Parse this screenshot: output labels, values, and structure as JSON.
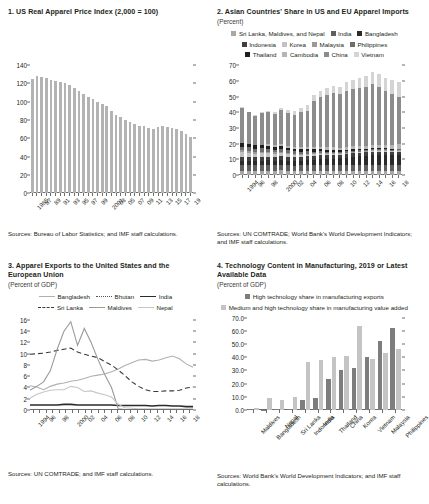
{
  "panel1": {
    "title": "1. US Real Apparel Price Index (2,000 = 100)",
    "source": "Sources: Bureau of Labor Statistics; and IMF staff calculations.",
    "chart_data": {
      "type": "bar",
      "title": "US Real Apparel Price Index (2,000 = 100)",
      "xlabel": "",
      "ylabel": "",
      "ylim": [
        0,
        140
      ],
      "yticks": [
        0,
        20,
        40,
        60,
        80,
        100,
        120,
        140
      ],
      "grid": false,
      "bar_color": "#b3b3b3",
      "categories": [
        "1985",
        "86",
        "87",
        "88",
        "89",
        "90",
        "91",
        "92",
        "93",
        "94",
        "95",
        "96",
        "97",
        "98",
        "99",
        "2000",
        "01",
        "02",
        "03",
        "04",
        "05",
        "06",
        "07",
        "08",
        "09",
        "10",
        "11",
        "12",
        "13",
        "14",
        "15",
        "16",
        "17",
        "18",
        "19"
      ],
      "tick_labels": [
        "1985",
        "",
        "87",
        "",
        "89",
        "",
        "91",
        "",
        "93",
        "",
        "95",
        "",
        "97",
        "",
        "99",
        "",
        "2001",
        "",
        "03",
        "",
        "05",
        "",
        "07",
        "",
        "09",
        "",
        "11",
        "",
        "13",
        "",
        "15",
        "",
        "17",
        "",
        "19"
      ],
      "values": [
        125,
        128,
        127,
        126,
        124,
        123,
        122,
        121,
        118,
        115,
        112,
        108,
        105,
        103,
        100,
        98,
        95,
        90,
        86,
        83,
        80,
        78,
        76,
        74,
        73,
        71,
        70,
        72,
        73,
        72,
        71,
        70,
        68,
        65,
        62
      ]
    }
  },
  "panel2": {
    "title": "2. Asian Countries' Share in US and EU Apparel Imports",
    "subtitle": "(Percent)",
    "source": "Sources: UN COMTRADE; World Bank's World Development Indicators; and IMF staff calculations.",
    "legend_rows": [
      [
        {
          "label": "Sri Lanka, Maldives, and Nepal",
          "color": "#a8a8a8"
        },
        {
          "label": "India",
          "color": "#5f5f5f"
        },
        {
          "label": "Bangladesh",
          "color": "#2b2b2b"
        }
      ],
      [
        {
          "label": "Indonesia",
          "color": "#3f3f3f"
        },
        {
          "label": "Korea",
          "color": "#c2c2c2"
        },
        {
          "label": "Malaysia",
          "color": "#9a9a9a"
        },
        {
          "label": "Philippines",
          "color": "#6e6e6e"
        }
      ],
      [
        {
          "label": "Thailand",
          "color": "#1f1f1f"
        },
        {
          "label": "Cambodia",
          "color": "#b5b5b5"
        },
        {
          "label": "China",
          "color": "#8c8c8c"
        },
        {
          "label": "Vietnam",
          "color": "#d4d4d4"
        }
      ]
    ],
    "chart_data": {
      "type": "bar",
      "stacked": true,
      "title": "Asian Countries' Share in US and EU Apparel Imports",
      "xlabel": "",
      "ylabel": "Percent",
      "ylim": [
        0,
        70
      ],
      "yticks": [
        0,
        10,
        20,
        30,
        40,
        50,
        60,
        70
      ],
      "grid": false,
      "categories": [
        "1994",
        "95",
        "96",
        "97",
        "98",
        "99",
        "2000",
        "01",
        "02",
        "03",
        "04",
        "05",
        "06",
        "07",
        "08",
        "09",
        "10",
        "11",
        "12",
        "13",
        "14",
        "15",
        "16",
        "17",
        "18"
      ],
      "tick_labels": [
        "1994",
        "",
        "96",
        "",
        "98",
        "",
        "2000",
        "",
        "02",
        "",
        "04",
        "",
        "06",
        "",
        "08",
        "",
        "10",
        "",
        "12",
        "",
        "14",
        "",
        "16",
        "",
        "18"
      ],
      "series": [
        {
          "name": "Sri Lanka, Maldives, and Nepal",
          "color": "#a8a8a8",
          "values": [
            3.0,
            2.9,
            2.8,
            2.9,
            3.0,
            2.9,
            3.1,
            2.8,
            2.7,
            2.8,
            2.9,
            2.6,
            2.6,
            2.6,
            2.6,
            2.5,
            2.5,
            2.6,
            2.6,
            2.6,
            2.7,
            2.6,
            2.6,
            2.5,
            2.5
          ]
        },
        {
          "name": "India",
          "color": "#5f5f5f",
          "values": [
            3.6,
            3.5,
            3.4,
            3.5,
            3.6,
            3.5,
            3.7,
            3.5,
            3.4,
            3.5,
            3.6,
            3.9,
            3.9,
            3.8,
            3.7,
            3.7,
            3.7,
            3.8,
            3.8,
            3.9,
            4.0,
            3.9,
            3.8,
            3.7,
            3.7
          ]
        },
        {
          "name": "Bangladesh",
          "color": "#2b2b2b",
          "values": [
            2.6,
            2.7,
            2.8,
            2.9,
            3.0,
            2.9,
            3.0,
            3.0,
            2.9,
            3.0,
            3.2,
            3.5,
            3.8,
            4.0,
            4.3,
            4.6,
            4.9,
            5.3,
            5.6,
            5.9,
            6.2,
            6.4,
            6.6,
            6.7,
            6.8
          ]
        },
        {
          "name": "Indonesia",
          "color": "#3f3f3f",
          "values": [
            2.4,
            2.4,
            2.3,
            2.4,
            2.3,
            2.3,
            2.5,
            2.4,
            2.3,
            2.3,
            2.3,
            2.3,
            2.3,
            2.3,
            2.3,
            2.2,
            2.2,
            2.2,
            2.2,
            2.1,
            2.1,
            2.0,
            2.0,
            2.0,
            2.0
          ]
        },
        {
          "name": "Korea",
          "color": "#c2c2c2",
          "values": [
            3.2,
            2.9,
            2.5,
            2.3,
            2.1,
            1.9,
            1.8,
            1.6,
            1.4,
            1.2,
            1.0,
            0.9,
            0.8,
            0.7,
            0.6,
            0.5,
            0.5,
            0.5,
            0.4,
            0.4,
            0.4,
            0.4,
            0.4,
            0.4,
            0.4
          ]
        },
        {
          "name": "Malaysia",
          "color": "#9a9a9a",
          "values": [
            1.3,
            1.2,
            1.2,
            1.1,
            1.1,
            1.0,
            1.0,
            0.9,
            0.9,
            0.8,
            0.8,
            0.7,
            0.7,
            0.7,
            0.6,
            0.6,
            0.6,
            0.6,
            0.5,
            0.5,
            0.5,
            0.5,
            0.5,
            0.4,
            0.4
          ]
        },
        {
          "name": "Philippines",
          "color": "#6e6e6e",
          "values": [
            2.2,
            2.1,
            2.0,
            2.0,
            1.9,
            1.8,
            1.8,
            1.7,
            1.6,
            1.5,
            1.4,
            1.2,
            1.1,
            1.0,
            0.9,
            0.8,
            0.8,
            0.7,
            0.7,
            0.7,
            0.7,
            0.6,
            0.6,
            0.6,
            0.6
          ]
        },
        {
          "name": "Thailand",
          "color": "#1f1f1f",
          "values": [
            2.2,
            2.1,
            2.0,
            1.9,
            1.9,
            1.8,
            1.8,
            1.7,
            1.6,
            1.5,
            1.4,
            1.3,
            1.2,
            1.1,
            1.0,
            0.9,
            0.9,
            0.8,
            0.8,
            0.7,
            0.7,
            0.7,
            0.6,
            0.6,
            0.6
          ]
        },
        {
          "name": "Cambodia",
          "color": "#b5b5b5",
          "values": [
            0.1,
            0.2,
            0.3,
            0.5,
            0.7,
            0.9,
            1.1,
            1.2,
            1.3,
            1.4,
            1.5,
            1.5,
            1.6,
            1.7,
            1.7,
            1.7,
            1.8,
            1.9,
            2.0,
            2.1,
            2.2,
            2.3,
            2.4,
            2.5,
            2.6
          ]
        },
        {
          "name": "China",
          "color": "#8c8c8c",
          "values": [
            22.5,
            20.0,
            18.5,
            20.0,
            20.5,
            20.0,
            21.5,
            21.0,
            20.5,
            22.0,
            23.0,
            29.5,
            32.0,
            33.5,
            34.5,
            34.0,
            36.0,
            36.5,
            37.0,
            37.5,
            38.5,
            37.0,
            34.0,
            32.5,
            30.5
          ]
        },
        {
          "name": "Vietnam",
          "color": "#d4d4d4",
          "values": [
            0.3,
            0.5,
            0.7,
            0.9,
            1.1,
            1.3,
            1.5,
            1.8,
            2.4,
            3.0,
            3.4,
            3.6,
            3.9,
            4.3,
            4.7,
            4.9,
            5.3,
            5.9,
            6.4,
            6.9,
            7.4,
            7.8,
            8.2,
            8.6,
            9.0
          ]
        }
      ]
    }
  },
  "panel3": {
    "title": "3. Apparel Exports to the United States and the European Union",
    "subtitle": "(Percent of GDP)",
    "source": "Sources: UN COMTRADE; and IMF staff calculations.",
    "legend_rows": [
      [
        {
          "label": "Bangladesh",
          "color": "#b0b0b0",
          "style": "solid"
        },
        {
          "label": "Bhutan",
          "color": "#555555",
          "style": "dotted"
        },
        {
          "label": "India",
          "color": "#2b2b2b",
          "style": "solid-thick"
        }
      ],
      [
        {
          "label": "Sri Lanka",
          "color": "#3a3a3a",
          "style": "dashed"
        },
        {
          "label": "Maldives",
          "color": "#9a9a9a",
          "style": "solid"
        },
        {
          "label": "Nepal",
          "color": "#c6c6c6",
          "style": "solid"
        }
      ]
    ],
    "chart_data": {
      "type": "line",
      "title": "Apparel Exports to the United States and the European Union",
      "xlabel": "",
      "ylabel": "Percent of GDP",
      "ylim": [
        0,
        16
      ],
      "yticks": [
        0,
        2,
        4,
        6,
        8,
        10,
        12,
        14,
        16
      ],
      "grid": false,
      "x": [
        "1994",
        "95",
        "96",
        "97",
        "98",
        "99",
        "2000",
        "01",
        "02",
        "03",
        "04",
        "05",
        "06",
        "07",
        "08",
        "09",
        "10",
        "11",
        "12",
        "13",
        "14",
        "15",
        "16",
        "17",
        "18"
      ],
      "tick_labels": [
        "1994",
        "",
        "96",
        "",
        "98",
        "",
        "2000",
        "",
        "02",
        "",
        "04",
        "",
        "06",
        "",
        "08",
        "",
        "10",
        "",
        "12",
        "",
        "14",
        "",
        "16",
        "",
        "18"
      ],
      "series": [
        {
          "name": "Bangladesh",
          "color": "#b0b0b0",
          "style": "solid",
          "values": [
            4.3,
            4.1,
            3.6,
            4.2,
            4.6,
            4.8,
            5.1,
            5.3,
            5.6,
            6.0,
            6.2,
            6.4,
            6.8,
            7.3,
            7.9,
            8.4,
            8.9,
            9.0,
            8.7,
            8.9,
            9.3,
            9.6,
            9.1,
            8.2,
            7.6
          ]
        },
        {
          "name": "Bhutan",
          "color": "#555555",
          "style": "dotted",
          "values": [
            0.1,
            0.1,
            0.1,
            0.1,
            0.1,
            0.1,
            0.1,
            0.1,
            0.1,
            0.1,
            0.1,
            0.1,
            0.1,
            0.1,
            0.1,
            0.1,
            0.1,
            0.1,
            0.1,
            0.1,
            0.1,
            0.1,
            0.1,
            0.1,
            0.1
          ]
        },
        {
          "name": "India",
          "color": "#2b2b2b",
          "style": "solid-thick",
          "values": [
            0.9,
            0.9,
            0.9,
            0.9,
            0.9,
            1.0,
            1.0,
            0.9,
            0.9,
            0.9,
            0.9,
            0.9,
            0.9,
            0.8,
            0.8,
            0.8,
            0.8,
            0.8,
            0.7,
            0.8,
            0.8,
            0.7,
            0.7,
            0.6,
            0.6
          ]
        },
        {
          "name": "Sri Lanka",
          "color": "#3a3a3a",
          "style": "dashed",
          "values": [
            9.9,
            10.0,
            10.1,
            10.3,
            10.6,
            10.8,
            11.0,
            10.3,
            9.9,
            9.6,
            9.3,
            8.6,
            8.0,
            7.1,
            6.1,
            5.0,
            4.2,
            3.6,
            3.3,
            3.3,
            3.4,
            3.4,
            3.5,
            3.9,
            4.1
          ]
        },
        {
          "name": "Maldives",
          "color": "#9a9a9a",
          "style": "solid",
          "values": [
            3.5,
            4.2,
            5.0,
            7.0,
            10.8,
            14.0,
            15.7,
            11.5,
            14.5,
            12.0,
            9.0,
            6.3,
            4.0,
            0.2,
            0.1,
            0.1,
            0.1,
            0.1,
            0.1,
            0.1,
            0.1,
            0.1,
            0.1,
            0.1,
            0.1
          ]
        },
        {
          "name": "Nepal",
          "color": "#c6c6c6",
          "style": "solid",
          "values": [
            2.1,
            2.8,
            3.2,
            3.5,
            3.6,
            3.6,
            4.2,
            4.0,
            3.3,
            3.4,
            3.0,
            2.7,
            2.3,
            1.0,
            0.4,
            0.3,
            0.2,
            0.2,
            0.2,
            0.2,
            0.2,
            0.2,
            0.2,
            0.2,
            0.2
          ]
        }
      ]
    }
  },
  "panel4": {
    "title": "4. Technology Content in Manufacturing, 2019 or Latest Available Data",
    "subtitle": "(Percent of GDP)",
    "source": "Sources: World Bank's World Development Indicators; and IMF staff calculations.",
    "legend_rows": [
      [
        {
          "label": "High technology share in manufacturing exports",
          "color": "#7d7d7d"
        }
      ],
      [
        {
          "label": "Medium and high technology share in manufacturing value added",
          "color": "#c4c4c4"
        }
      ]
    ],
    "chart_data": {
      "type": "bar",
      "grouped": true,
      "title": "Technology Content in Manufacturing, 2019 or Latest Available Data",
      "xlabel": "",
      "ylabel": "Percent of GDP",
      "ylim": [
        0,
        70
      ],
      "yticks": [
        "0.0",
        "10.0",
        "20.0",
        "30.0",
        "40.0",
        "50.0",
        "60.0",
        "70.0"
      ],
      "grid": false,
      "categories": [
        "Maldives",
        "Bangladesh",
        "Nepal",
        "Sri Lanka",
        "Indonesia",
        "India",
        "Thailand",
        "China",
        "Korea",
        "Vietnam",
        "Malaysia",
        "Philippines"
      ],
      "series": [
        {
          "name": "High technology share in manufacturing exports",
          "color": "#7d7d7d",
          "values": [
            0.4,
            0.3,
            0.6,
            0.9,
            7.5,
            9.2,
            23.5,
            30.5,
            31.8,
            40.5,
            52.5,
            62.0
          ]
        },
        {
          "name": "Medium and high technology share in manufacturing value added",
          "color": "#c4c4c4",
          "values": [
            1.6,
            9.0,
            7.8,
            9.5,
            36.5,
            38.0,
            40.5,
            40.8,
            63.5,
            38.8,
            43.0,
            46.5
          ]
        }
      ]
    }
  }
}
